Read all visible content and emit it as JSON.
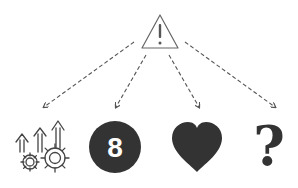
{
  "diagram": {
    "root": {
      "icon": "warning-triangle-icon",
      "symbol": "!"
    },
    "children": [
      {
        "icon": "growth-arrows-gears-icon"
      },
      {
        "icon": "eight-ball-icon",
        "label": "8"
      },
      {
        "icon": "heart-icon"
      },
      {
        "icon": "question-mark-icon",
        "symbol": "?"
      }
    ],
    "edges": [
      {
        "from": "root",
        "to": 0,
        "style": "dashed-arrow"
      },
      {
        "from": "root",
        "to": 1,
        "style": "dashed-arrow"
      },
      {
        "from": "root",
        "to": 2,
        "style": "dashed-arrow"
      },
      {
        "from": "root",
        "to": 3,
        "style": "dashed-arrow"
      }
    ],
    "colors": {
      "stroke": "#555555",
      "fill": "#333333",
      "background": "#ffffff"
    }
  }
}
